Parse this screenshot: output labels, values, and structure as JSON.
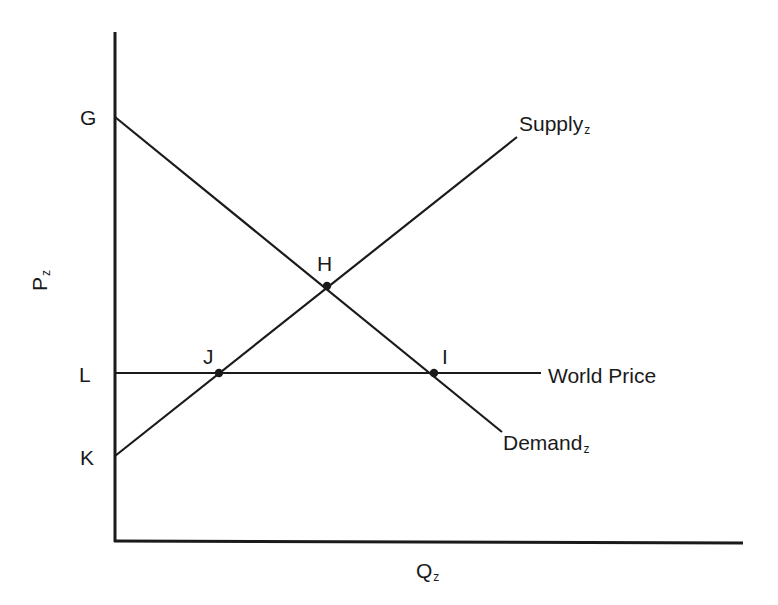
{
  "diagram": {
    "title": "",
    "axes": {
      "y_label": "P",
      "y_label_sub": "z",
      "x_label": "Q",
      "x_label_sub": "z"
    },
    "curves": {
      "supply": {
        "label": "Supply",
        "sub": "z"
      },
      "demand": {
        "label": "Demand",
        "sub": "z"
      },
      "world_price": {
        "label": "World Price"
      }
    },
    "points": {
      "G": "G",
      "H": "H",
      "I": "I",
      "J": "J",
      "K": "K",
      "L": "L"
    },
    "colors": {
      "ink": "#1a1a1a",
      "background": "#ffffff"
    }
  }
}
